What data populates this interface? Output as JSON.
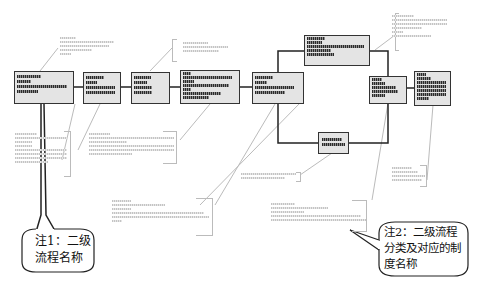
{
  "diagram": {
    "title": "",
    "nodes": [
      {
        "id": "n1",
        "label": "",
        "bars": [
          60,
          30,
          95,
          45
        ]
      },
      {
        "id": "n2",
        "label": "",
        "bars": [
          50,
          30,
          85,
          85
        ]
      },
      {
        "id": "n3",
        "label": "",
        "bars": [
          60,
          40,
          70,
          70
        ]
      },
      {
        "id": "n4",
        "label": "",
        "bars": [
          20,
          95,
          30,
          90,
          20,
          70,
          60
        ]
      },
      {
        "id": "n5",
        "label": "",
        "bars": [
          40,
          30,
          85,
          70
        ]
      },
      {
        "id": "n6",
        "label": "",
        "bars": [
          40,
          30,
          95,
          55,
          60
        ]
      },
      {
        "id": "n7",
        "label": "",
        "bars": [
          85
        ]
      },
      {
        "id": "n8",
        "label": "",
        "bars": [
          30,
          40,
          70,
          80
        ]
      },
      {
        "id": "n9",
        "label": "",
        "bars": [
          40,
          60,
          95,
          95,
          95,
          40
        ]
      }
    ],
    "callouts": [
      {
        "id": "note1",
        "line1": "注1：二级",
        "line2": "流程名称"
      },
      {
        "id": "note2",
        "line1": "注2：二级流程",
        "line2": "分类及对应的制",
        "line3": "度名称"
      }
    ]
  },
  "colors": {
    "node_fill": "#e4e4e4",
    "node_border": "#333333",
    "annotation_gray": "#bbbbbb"
  }
}
